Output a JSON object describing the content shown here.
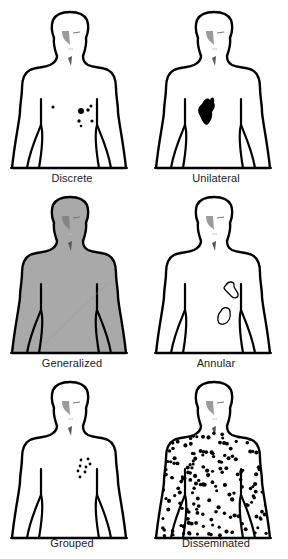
{
  "figure": {
    "panels": [
      {
        "id": "discrete",
        "label": "Discrete",
        "fill": "#ffffff",
        "lesions": {
          "dots": [
            [
              53,
              107,
              1.6
            ],
            [
              81,
              111,
              3.0
            ],
            [
              91,
              106,
              1.5
            ],
            [
              88,
              110,
              1.7
            ],
            [
              92,
              121,
              1.6
            ],
            [
              79,
              121,
              1.7
            ],
            [
              81,
              126,
              1.3
            ]
          ],
          "blobs": [],
          "rings": []
        }
      },
      {
        "id": "unilateral",
        "label": "Unilateral",
        "fill": "#ffffff",
        "lesions": {
          "dots": [],
          "blobs": [
            "M58,104 C60,99 64,97 66,100 C68,96 71,97 70,103 C72,105 70,110 68,112 C69,116 67,122 63,125 C59,124 57,118 55,114 C53,110 55,106 58,104 Z"
          ],
          "rings": []
        }
      },
      {
        "id": "generalized",
        "label": "Generalized",
        "fill": "#a9a9a9",
        "lesions": {
          "dots": [],
          "blobs": [],
          "rings": []
        }
      },
      {
        "id": "annular",
        "label": "Annular",
        "fill": "#ffffff",
        "lesions": {
          "dots": [],
          "blobs": [],
          "rings": [
            "M82,100 C84,96 90,96 90,100 C89,103 93,105 94,109 C95,113 90,114 87,111 C85,108 81,106 80,103 C80,102 81,101 82,100 Z",
            "M77,126 C79,121 86,122 86,127 C87,132 85,137 80,139 C75,140 73,137 74,132 C74,129 76,127 77,126 Z"
          ]
        }
      },
      {
        "id": "grouped",
        "label": "Grouped",
        "fill": "#ffffff",
        "lesions": {
          "dots": [
            [
              81,
              90,
              1.4
            ],
            [
              88,
              89,
              1.4
            ],
            [
              90,
              94,
              1.4
            ],
            [
              80,
              96,
              1.4
            ],
            [
              86,
              97,
              1.4
            ],
            [
              78,
              101,
              1.4
            ],
            [
              85,
              102,
              1.4
            ],
            [
              80,
              107,
              1.4
            ]
          ],
          "blobs": [],
          "rings": []
        }
      },
      {
        "id": "disseminated",
        "label": "Disseminated",
        "fill": "#ffffff",
        "lesions": {
          "dots": "scattered",
          "blobs": [],
          "rings": []
        }
      }
    ]
  }
}
